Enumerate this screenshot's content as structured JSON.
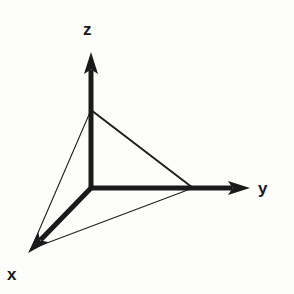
{
  "figure": {
    "background_color": "#fdfdfc",
    "stroke_color": "#1a1a1a"
  },
  "labels": {
    "z": "z",
    "y": "y",
    "x": "x"
  },
  "chart_data": {
    "type": "diagram",
    "origin": [
      91,
      188
    ],
    "axes": [
      {
        "name": "z",
        "label": "z",
        "from": [
          91,
          188
        ],
        "to": [
          91,
          52
        ],
        "arrow": true,
        "stroke_width": 5,
        "label_pos": [
          88,
          30
        ]
      },
      {
        "name": "y",
        "label": "y",
        "from": [
          91,
          188
        ],
        "to": [
          250,
          188
        ],
        "arrow": true,
        "stroke_width": 5,
        "label_pos": [
          265,
          190
        ]
      },
      {
        "name": "x",
        "label": "x",
        "from": [
          91,
          188
        ],
        "to": [
          28,
          253
        ],
        "arrow": true,
        "stroke_width": 5,
        "label_pos": [
          13,
          276
        ]
      }
    ],
    "triangle": {
      "vertices": {
        "z_intercept": [
          91,
          110
        ],
        "y_intercept": [
          193,
          188
        ],
        "x_intercept": [
          31,
          249
        ]
      },
      "edges": [
        {
          "name": "z-to-y",
          "from": [
            91,
            110
          ],
          "to": [
            193,
            188
          ],
          "stroke_width": 2.0
        },
        {
          "name": "z-to-x",
          "from": [
            91,
            110
          ],
          "to": [
            31,
            249
          ],
          "stroke_width": 1.1
        },
        {
          "name": "x-to-y",
          "from": [
            31,
            249
          ],
          "to": [
            193,
            188
          ],
          "stroke_width": 1.1
        }
      ]
    },
    "xlabel": "x",
    "ylabel": "y",
    "zlabel": "z"
  }
}
